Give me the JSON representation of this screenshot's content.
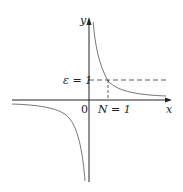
{
  "diagram": {
    "function": "y = 1/x",
    "labels": {
      "y_axis": "y",
      "x_axis": "x",
      "origin": "0",
      "epsilon": "ε = 1",
      "N": "N = 1"
    },
    "colors": {
      "axis": "#222222",
      "curve": "#555555",
      "dashed": "#333333"
    }
  }
}
